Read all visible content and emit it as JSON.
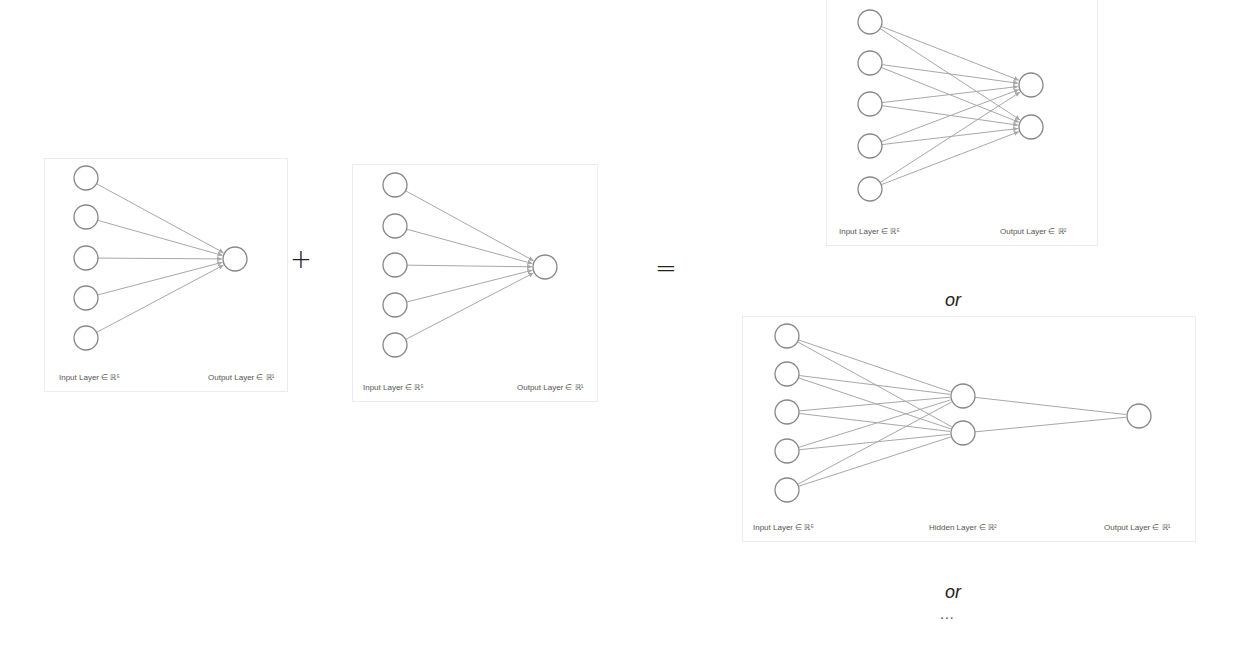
{
  "diagram": {
    "node_stroke": "#888888",
    "edge_stroke": "#a8a8a8",
    "node_radius": 12
  },
  "panels": [
    {
      "id": "panel-a",
      "box": {
        "x": 44,
        "y": 158,
        "w": 242,
        "h": 232
      },
      "layers": [
        {
          "x": 41,
          "ys": [
            19,
            58,
            99,
            139,
            179
          ]
        },
        {
          "x": 190,
          "ys": [
            100
          ]
        }
      ],
      "arrows": true,
      "labels": [
        {
          "text": "Input Layer ∈ ℝ⁵",
          "x": 14,
          "y": 214
        },
        {
          "text": "Output Layer ∈ ℝ¹",
          "x": 163,
          "y": 214
        }
      ]
    },
    {
      "id": "panel-b",
      "box": {
        "x": 352,
        "y": 164,
        "w": 244,
        "h": 236
      },
      "layers": [
        {
          "x": 42,
          "ys": [
            20,
            61,
            100,
            140,
            180
          ]
        },
        {
          "x": 192,
          "ys": [
            102
          ]
        }
      ],
      "arrows": true,
      "labels": [
        {
          "text": "Input Layer ∈ ℝ⁵",
          "x": 10,
          "y": 218
        },
        {
          "text": "Output Layer ∈ ℝ¹",
          "x": 164,
          "y": 218
        }
      ]
    },
    {
      "id": "panel-c",
      "box": {
        "x": 826,
        "y": -6,
        "w": 270,
        "h": 250
      },
      "layers": [
        {
          "x": 43,
          "ys": [
            27,
            68,
            109,
            151,
            194
          ]
        },
        {
          "x": 204,
          "ys": [
            90,
            132
          ]
        }
      ],
      "arrows": true,
      "labels": [
        {
          "text": "Input Layer ∈ ℝ⁵",
          "x": 12,
          "y": 232
        },
        {
          "text": "Output Layer ∈ ℝ²",
          "x": 173,
          "y": 232
        }
      ]
    },
    {
      "id": "panel-d",
      "box": {
        "x": 742,
        "y": 316,
        "w": 452,
        "h": 224
      },
      "layers": [
        {
          "x": 44,
          "ys": [
            19,
            57,
            95,
            134,
            173
          ]
        },
        {
          "x": 220,
          "ys": [
            79,
            116
          ]
        },
        {
          "x": 396,
          "ys": [
            99
          ]
        }
      ],
      "arrows": false,
      "labels": [
        {
          "text": "Input Layer ∈ ℝ⁵",
          "x": 10,
          "y": 206
        },
        {
          "text": "Hidden Layer ∈ ℝ²",
          "x": 186,
          "y": 206
        },
        {
          "text": "Output Layer ∈ ℝ¹",
          "x": 361,
          "y": 206
        }
      ]
    }
  ],
  "operators": {
    "plus": "+",
    "equals": "="
  },
  "alternatives": {
    "or_1": "or",
    "or_2": "or",
    "ellipsis": "..."
  }
}
